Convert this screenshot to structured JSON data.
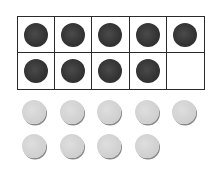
{
  "ten_frame": {
    "rows": 2,
    "columns": 5,
    "filled_count": 9,
    "cells": [
      {
        "filled": true
      },
      {
        "filled": true
      },
      {
        "filled": true
      },
      {
        "filled": true
      },
      {
        "filled": true
      },
      {
        "filled": true
      },
      {
        "filled": true
      },
      {
        "filled": true
      },
      {
        "filled": true
      },
      {
        "filled": false
      }
    ],
    "counter_color": "#333333",
    "border_color": "#2a2a2a"
  },
  "loose_counters": {
    "count": 9,
    "rows": [
      5,
      4
    ],
    "color": "#cfcfcf"
  }
}
